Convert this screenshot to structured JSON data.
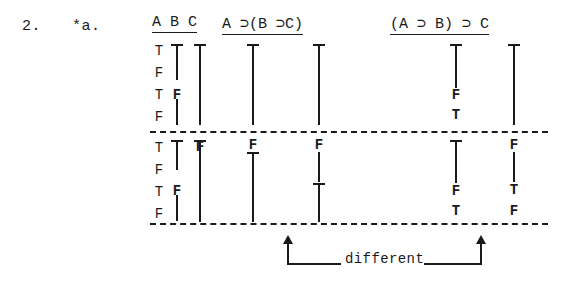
{
  "exercise": {
    "number": "2.",
    "part": "*a."
  },
  "table": {
    "headers": {
      "variables": "A B C",
      "formula_1": "A ⊃(B ⊃C)",
      "formula_2": "(A ⊃ B) ⊃ C"
    },
    "column_keys": [
      "A",
      "B",
      "C",
      "f1_main",
      "f1_inner",
      "f2_inner",
      "f2_main"
    ],
    "rows": [
      {
        "A": "T",
        "B": "T",
        "C": "T",
        "f1_main": "T",
        "f1_inner": "T",
        "f2_inner": "T",
        "f2_main": "T"
      },
      {
        "A": "F",
        "B": "T",
        "C": "T",
        "f1_main": "T",
        "f1_inner": "T",
        "f2_inner": "T",
        "f2_main": "T"
      },
      {
        "A": "T",
        "B": "F",
        "C": "T",
        "f1_main": "T",
        "f1_inner": "T",
        "f2_inner": "F",
        "f2_main": "T"
      },
      {
        "A": "F",
        "B": "F",
        "C": "T",
        "f1_main": "T",
        "f1_inner": "T",
        "f2_inner": "T",
        "f2_main": "T"
      },
      {
        "A": "T",
        "B": "T",
        "C": "F",
        "f1_main": "F",
        "f1_inner": "F",
        "f2_inner": "T",
        "f2_main": "F"
      },
      {
        "A": "F",
        "B": "T",
        "C": "F",
        "f1_main": "T",
        "f1_inner": "F",
        "f2_inner": "T",
        "f2_main": "T"
      },
      {
        "A": "T",
        "B": "F",
        "C": "F",
        "f1_main": "T",
        "f1_inner": "T",
        "f2_inner": "F",
        "f2_main": "T"
      },
      {
        "A": "F",
        "B": "F",
        "C": "F",
        "f1_main": "T",
        "f1_inner": "T",
        "f2_inner": "T",
        "f2_main": "F"
      }
    ],
    "written_marks": {
      "note": "Repeated truth values are written as vertical ditto strokes; only changed values are lettered.",
      "col_A": [
        "T",
        "F",
        "T",
        "F",
        "T",
        "F",
        "T",
        "F"
      ],
      "col_B": [
        "T",
        "stroke",
        "F",
        "stroke",
        "T",
        "F",
        "F",
        "stroke"
      ],
      "col_C": [
        "T",
        "stroke",
        "stroke",
        "stroke",
        "F",
        "stroke",
        "stroke",
        "stroke"
      ],
      "col_f1_main": [
        "T",
        "stroke",
        "stroke",
        "stroke",
        "F",
        "stroke",
        "stroke",
        "stroke"
      ],
      "col_f1_inner": [
        "T",
        "stroke",
        "stroke",
        "stroke",
        "F",
        "stroke",
        "T",
        "stroke"
      ],
      "col_f2_inner": [
        "T",
        "stroke",
        "F",
        "T",
        "T",
        "stroke",
        "F",
        "T"
      ],
      "col_f2_main": [
        "T",
        "stroke",
        "stroke",
        "stroke",
        "F",
        "stroke",
        "T",
        "F"
      ]
    }
  },
  "annotation": {
    "label": "different",
    "left_arrow": "up-arrow",
    "right_arrow": "up-arrow"
  },
  "colors": {
    "ink": "#1a1a1a",
    "paper": "#ffffff"
  }
}
